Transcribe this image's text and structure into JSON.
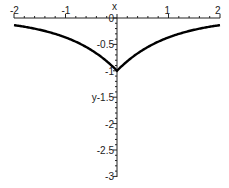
{
  "chart_data": {
    "type": "line",
    "title": "",
    "xlabel": "x",
    "ylabel": "y",
    "xlim": [
      -2,
      2
    ],
    "ylim": [
      -3,
      0
    ],
    "grid": false,
    "legend": null,
    "x_ticks": [
      -2,
      -1,
      1,
      2
    ],
    "x_tick_labels": [
      "-2",
      "-1",
      "1",
      "2"
    ],
    "y_ticks": [
      0,
      -0.5,
      -1,
      -1.5,
      -2,
      -2.5,
      -3
    ],
    "y_tick_labels": [
      "0",
      "-0.5",
      "-1",
      "y-1.5",
      "-2",
      "-2.5",
      "-3"
    ],
    "series": [
      {
        "name": "y = -exp(-|x|)",
        "x": [
          -2,
          -1.5,
          -1,
          -0.5,
          0,
          0.5,
          1,
          1.5,
          2
        ],
        "y": [
          -0.14,
          -0.22,
          -0.37,
          -0.61,
          -1,
          -0.61,
          -0.37,
          -0.22,
          -0.14
        ],
        "color": "#000000"
      }
    ],
    "annotations": [
      "cusp at (0, -1)"
    ]
  }
}
